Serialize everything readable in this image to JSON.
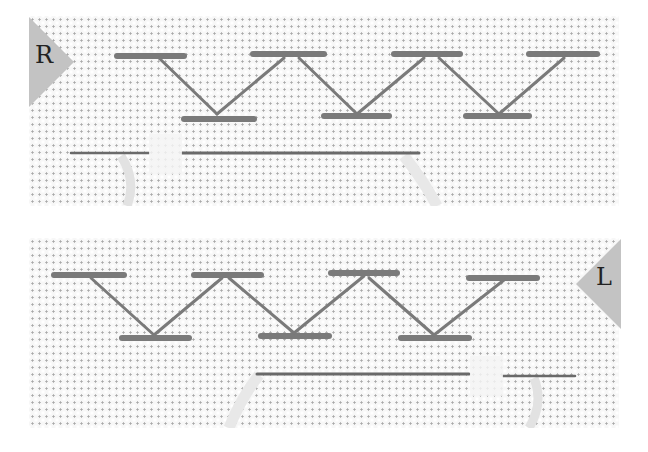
{
  "figure": {
    "colors": {
      "fabric": "#f7f7f7",
      "fabric_hole": "#a9a9a9",
      "thread": "#7a7a7a",
      "needle": "#6a6a6a",
      "marker": "#c3c3c3"
    },
    "panels": [
      {
        "id": "top",
        "direction_marker": {
          "label": "R",
          "side": "left",
          "icon": "triangle-right-marker"
        },
        "upper_bars_x": [
          [
            88,
            190
          ],
          [
            225,
            323
          ],
          [
            365,
            460
          ],
          [
            500,
            596
          ]
        ],
        "lower_bars_x": [
          [
            155,
            232
          ],
          [
            290,
            390
          ],
          [
            430,
            530
          ]
        ],
        "needle": {
          "from_x": 40,
          "to_x": 390,
          "y": 137
        }
      },
      {
        "id": "bottom",
        "direction_marker": {
          "label": "L",
          "side": "right",
          "icon": "triangle-left-marker"
        },
        "upper_bars_x": [
          [
            25,
            110
          ],
          [
            165,
            245
          ],
          [
            300,
            383
          ],
          [
            440,
            520
          ]
        ],
        "lower_bars_x": [
          [
            90,
            165
          ],
          [
            230,
            320
          ],
          [
            370,
            460
          ]
        ],
        "needle": {
          "from_x": 225,
          "to_x": 575,
          "y": 374
        }
      }
    ]
  }
}
